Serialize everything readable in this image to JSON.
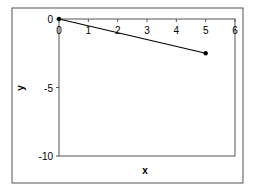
{
  "chart_data": {
    "type": "line",
    "title": "",
    "xlabel": "x",
    "ylabel": "y",
    "xlim": [
      0,
      6
    ],
    "ylim": [
      -10,
      0
    ],
    "xticks": [
      0,
      1,
      2,
      3,
      4,
      5,
      6
    ],
    "yticks": [
      0,
      -5,
      -10
    ],
    "grid": false,
    "legend": null,
    "series": [
      {
        "name": "series1",
        "x": [
          0,
          5
        ],
        "y": [
          0,
          -2.5
        ],
        "color": "#000000",
        "marker": "circle"
      }
    ]
  },
  "labels": {
    "xlabel": "x",
    "ylabel": "y",
    "xticks": [
      "0",
      "1",
      "2",
      "3",
      "4",
      "5",
      "6"
    ],
    "yticks": [
      "0",
      "-5",
      "-10"
    ]
  },
  "colors": {
    "frame": "#555555",
    "line": "#000000"
  }
}
